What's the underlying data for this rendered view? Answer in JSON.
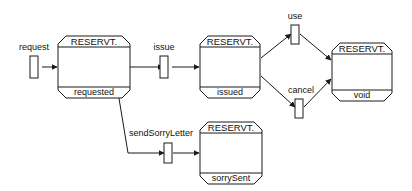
{
  "diagram": {
    "kind": "state-transition-diagram",
    "title": "",
    "background_color": "#ffffff",
    "line_color": "#1a1a1a",
    "text_color": "#111111",
    "states": [
      {
        "id": "requested",
        "type_name": "RESERVT.",
        "state_name": "requested",
        "x": 58,
        "y": 36,
        "width": 72,
        "height": 62
      },
      {
        "id": "issued",
        "type_name": "RESERVT.",
        "state_name": "issued",
        "x": 200,
        "y": 36,
        "width": 60,
        "height": 62
      },
      {
        "id": "void",
        "type_name": "RESERVT.",
        "state_name": "void",
        "x": 332,
        "y": 43,
        "width": 60,
        "height": 58
      },
      {
        "id": "sorrySent",
        "type_name": "RESERVT.",
        "state_name": "sorrySent",
        "x": 200,
        "y": 122,
        "width": 62,
        "height": 62
      }
    ],
    "transitions": [
      {
        "id": "request",
        "label": "request",
        "label_x": 41,
        "label_y": 48,
        "bar_x": 34,
        "bar_y": 56,
        "bar_width": 8,
        "bar_height": 22
      },
      {
        "id": "issue",
        "label": "issue",
        "label_x": 170,
        "label_y": 48,
        "bar_x": 164,
        "bar_y": 56,
        "bar_width": 8,
        "bar_height": 22
      },
      {
        "id": "use",
        "label": "use",
        "label_x": 296,
        "label_y": 17,
        "bar_x": 292,
        "bar_y": 24,
        "bar_width": 8,
        "bar_height": 18
      },
      {
        "id": "cancel",
        "label": "cancel",
        "label_x": 301,
        "label_y": 92,
        "bar_x": 296,
        "bar_y": 99,
        "bar_width": 8,
        "bar_height": 18
      },
      {
        "id": "sendSorryLetter",
        "label": "sendSorryLetter",
        "label_x": 162,
        "label_y": 133,
        "bar_x": 165,
        "bar_y": 144,
        "bar_width": 8,
        "bar_height": 18
      }
    ],
    "edges": [
      {
        "id": "request-to-requested",
        "from": "request",
        "to": "requested"
      },
      {
        "id": "requested-to-issue",
        "from": "requested",
        "to": "issue"
      },
      {
        "id": "issue-to-issued",
        "from": "issue",
        "to": "issued"
      },
      {
        "id": "requested-to-sendsorryletter",
        "from": "requested",
        "to": "sendSorryLetter"
      },
      {
        "id": "sendsorryletter-to-sorrysent",
        "from": "sendSorryLetter",
        "to": "sorrySent"
      },
      {
        "id": "issued-to-use",
        "from": "issued",
        "to": "use"
      },
      {
        "id": "use-to-void",
        "from": "use",
        "to": "void"
      },
      {
        "id": "issued-to-cancel",
        "from": "issued",
        "to": "cancel"
      },
      {
        "id": "cancel-to-void",
        "from": "cancel",
        "to": "void"
      }
    ]
  }
}
